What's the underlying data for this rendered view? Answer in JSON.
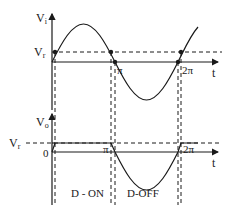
{
  "diagram": {
    "top_graph": {
      "y_axis_label": "V",
      "y_axis_sub": "i",
      "x_axis_label": "t",
      "ref_label": "V",
      "ref_sub": "r",
      "tick_pi": "π",
      "tick_2pi": "2π"
    },
    "bottom_graph": {
      "y_axis_label": "V",
      "y_axis_sub": "o",
      "x_axis_label": "t",
      "ref_label": "V",
      "ref_sub": "r",
      "zero_label": "0",
      "tick_pi": "π",
      "tick_2pi": "2π"
    },
    "regions": [
      {
        "label": "D - ON"
      },
      {
        "label": "D-OFF"
      }
    ],
    "colors": {
      "line": "#1a1a1a",
      "background": "#ffffff"
    }
  }
}
